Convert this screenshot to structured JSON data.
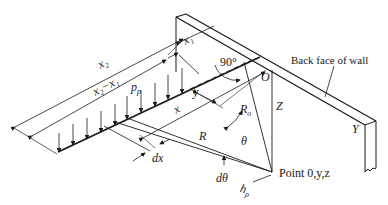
{
  "diagram": {
    "type": "engineering-figure",
    "labels": {
      "x2": "x₂",
      "x1": "x₁",
      "x2_minus_x1": "x₂−x₁",
      "pp": "p",
      "pp_sub": "p",
      "x": "x",
      "y": "y",
      "angle_90": "90°",
      "O": "O",
      "Z": "Z",
      "R0": "R",
      "R0_sub": "o",
      "R": "R",
      "theta": "θ",
      "dtheta": "dθ",
      "dx": "dx",
      "hp": "h",
      "hp_sub": "p",
      "point": "Point 0,y,z",
      "back_face": "Back face of wall",
      "Y": "Y"
    }
  }
}
